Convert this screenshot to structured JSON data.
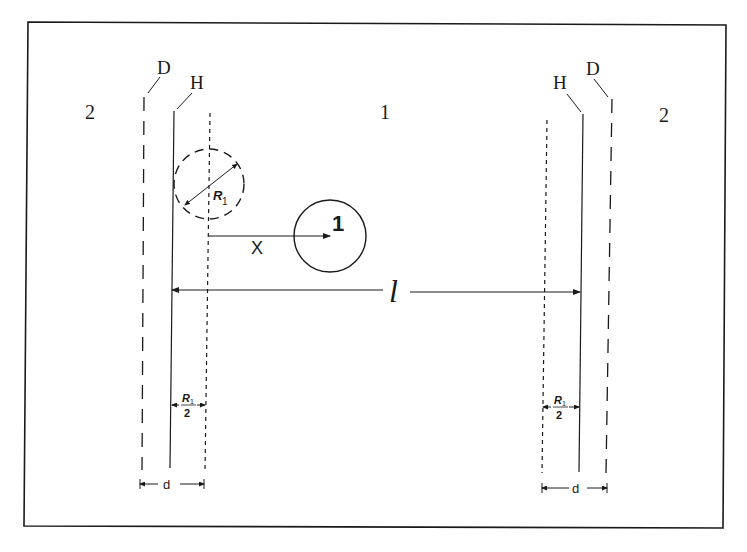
{
  "figure": {
    "title": "",
    "region_labels": {
      "left_outer": "2",
      "center": "1",
      "right_outer": "2"
    },
    "boundary_labels": {
      "left_D": "D",
      "left_H": "H",
      "right_H": "H",
      "right_D": "D"
    },
    "particle": {
      "label": "1",
      "radius_label_main": "R",
      "radius_label_sub": "1"
    },
    "distance_label": "X",
    "length_label": "l",
    "half_radius_left": {
      "numerator": "R",
      "sub": "1",
      "denominator": "2"
    },
    "half_radius_right": {
      "numerator": "R",
      "sub": "1",
      "denominator": "2"
    },
    "thickness_left": "d",
    "thickness_right": "d",
    "colors": {
      "ink": "#1a1a1a",
      "background": "#ffffff"
    }
  }
}
